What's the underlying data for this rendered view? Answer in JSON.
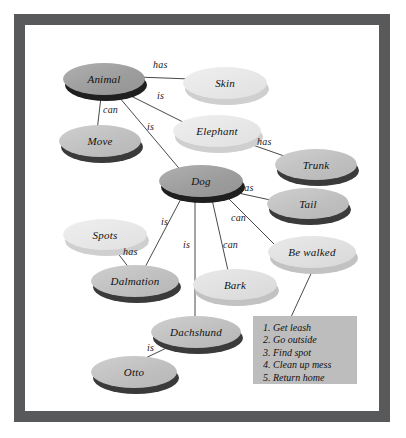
{
  "figure": {
    "kind": "semantic-network-diagram",
    "frame_color": "#58595b",
    "background_color": "#ffffff",
    "edge_color": "#333333"
  },
  "nodes": [
    {
      "id": "animal",
      "label": "Animal",
      "tone": "dark",
      "x": 38,
      "y": 38,
      "w": 82,
      "h": 32
    },
    {
      "id": "skin",
      "label": "Skin",
      "tone": "pale",
      "x": 158,
      "y": 42,
      "w": 84,
      "h": 32
    },
    {
      "id": "move",
      "label": "Move",
      "tone": "mid",
      "x": 34,
      "y": 100,
      "w": 82,
      "h": 32
    },
    {
      "id": "elephant",
      "label": "Elephant",
      "tone": "pale",
      "x": 148,
      "y": 90,
      "w": 88,
      "h": 32
    },
    {
      "id": "trunk",
      "label": "Trunk",
      "tone": "mid",
      "x": 250,
      "y": 124,
      "w": 82,
      "h": 31
    },
    {
      "id": "dog",
      "label": "Dog",
      "tone": "dark",
      "x": 134,
      "y": 140,
      "w": 84,
      "h": 32
    },
    {
      "id": "tail",
      "label": "Tail",
      "tone": "mid",
      "x": 242,
      "y": 163,
      "w": 82,
      "h": 31
    },
    {
      "id": "spots",
      "label": "Spots",
      "tone": "pale",
      "x": 38,
      "y": 194,
      "w": 84,
      "h": 31
    },
    {
      "id": "bewalked",
      "label": "Be walked",
      "tone": "light",
      "x": 243,
      "y": 211,
      "w": 88,
      "h": 32
    },
    {
      "id": "dalmation",
      "label": "Dalmation",
      "tone": "mid",
      "x": 66,
      "y": 240,
      "w": 88,
      "h": 32
    },
    {
      "id": "bark",
      "label": "Bark",
      "tone": "light",
      "x": 168,
      "y": 244,
      "w": 84,
      "h": 31
    },
    {
      "id": "dachshund",
      "label": "Dachshund",
      "tone": "mid",
      "x": 126,
      "y": 291,
      "w": 90,
      "h": 32
    },
    {
      "id": "otto",
      "label": "Otto",
      "tone": "mid",
      "x": 66,
      "y": 331,
      "w": 86,
      "h": 32
    }
  ],
  "edges": [
    {
      "id": "animal-skin",
      "from": "animal",
      "to": "skin",
      "label": "has",
      "x1": 112,
      "y1": 52,
      "x2": 166,
      "y2": 54,
      "lx": 128,
      "ly": 35
    },
    {
      "id": "animal-move",
      "from": "animal",
      "to": "move",
      "label": "can",
      "x1": 76,
      "y1": 72,
      "x2": 72,
      "y2": 106,
      "lx": 78,
      "ly": 80
    },
    {
      "id": "animal-elephant",
      "from": "animal",
      "to": "elephant",
      "label": "is",
      "x1": 104,
      "y1": 70,
      "x2": 160,
      "y2": 98,
      "lx": 132,
      "ly": 66
    },
    {
      "id": "animal-dog",
      "from": "animal",
      "to": "dog",
      "label": "is",
      "x1": 94,
      "y1": 72,
      "x2": 158,
      "y2": 148,
      "lx": 122,
      "ly": 97
    },
    {
      "id": "elephant-trunk",
      "from": "elephant",
      "to": "trunk",
      "label": "has",
      "x1": 222,
      "y1": 118,
      "x2": 262,
      "y2": 132,
      "lx": 232,
      "ly": 112
    },
    {
      "id": "dog-tail",
      "from": "dog",
      "to": "tail",
      "label": "has",
      "x1": 204,
      "y1": 166,
      "x2": 250,
      "y2": 176,
      "lx": 214,
      "ly": 158
    },
    {
      "id": "dog-bewalked",
      "from": "dog",
      "to": "bewalked",
      "label": "can",
      "x1": 198,
      "y1": 168,
      "x2": 250,
      "y2": 220,
      "lx": 206,
      "ly": 188
    },
    {
      "id": "dog-bark",
      "from": "dog",
      "to": "bark",
      "label": "can",
      "x1": 186,
      "y1": 170,
      "x2": 204,
      "y2": 250,
      "lx": 198,
      "ly": 215
    },
    {
      "id": "dog-dachshund",
      "from": "dog",
      "to": "dachshund",
      "label": "is",
      "x1": 170,
      "y1": 170,
      "x2": 170,
      "y2": 296,
      "lx": 158,
      "ly": 215
    },
    {
      "id": "dog-dalmation",
      "from": "dog",
      "to": "dalmation",
      "label": "is",
      "x1": 158,
      "y1": 170,
      "x2": 118,
      "y2": 246,
      "lx": 136,
      "ly": 192
    },
    {
      "id": "spots-dalmation",
      "from": "spots",
      "to": "dalmation",
      "label": "has",
      "x1": 88,
      "y1": 222,
      "x2": 108,
      "y2": 248,
      "lx": 98,
      "ly": 222
    },
    {
      "id": "dachshund-otto",
      "from": "dachshund",
      "to": "otto",
      "label": "is",
      "x1": 152,
      "y1": 318,
      "x2": 110,
      "y2": 338,
      "lx": 122,
      "ly": 318
    },
    {
      "id": "bewalked-procedure",
      "from": "bewalked",
      "to": "procedure",
      "label": "",
      "x1": 290,
      "y1": 240,
      "x2": 266,
      "y2": 292,
      "lx": 0,
      "ly": 0
    }
  ],
  "procedure_box": {
    "id": "procedure",
    "x": 228,
    "y": 291,
    "w": 104,
    "h": 68,
    "background_color": "#bdbdbd",
    "items": [
      "1. Get leash",
      "2. Go outside",
      "3. Find spot",
      "4. Clean up mess",
      "5. Return home"
    ]
  }
}
